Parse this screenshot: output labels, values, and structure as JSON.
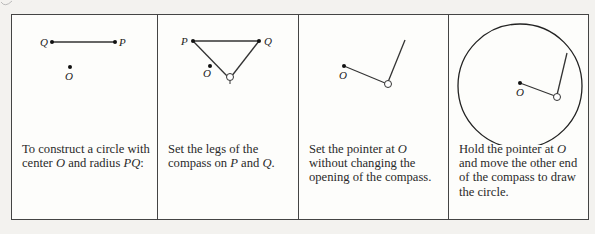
{
  "panels": [
    {
      "id": "step-0",
      "labels": {
        "Q": "Q",
        "P": "P",
        "O": "O"
      },
      "caption_parts": [
        "To construct a circle with center ",
        "O",
        " and radius ",
        "PQ",
        ":"
      ]
    },
    {
      "id": "step-1",
      "labels": {
        "P": "P",
        "Q": "Q",
        "O": "O"
      },
      "caption_parts": [
        "Set the legs of the compass on ",
        "P",
        " and ",
        "Q",
        "."
      ]
    },
    {
      "id": "step-2",
      "labels": {
        "O": "O"
      },
      "caption_parts": [
        "Set the pointer at ",
        "O",
        " without changing the opening of the compass."
      ]
    },
    {
      "id": "step-3",
      "labels": {
        "O": "O"
      },
      "caption_parts": [
        "Hold the pointer at ",
        "O",
        " and move the other end of the compass to draw the circle."
      ]
    }
  ],
  "colors": {
    "line": "#333333",
    "border": "#444444",
    "paper": "#fdfdfb",
    "background": "#f3f2ef"
  }
}
